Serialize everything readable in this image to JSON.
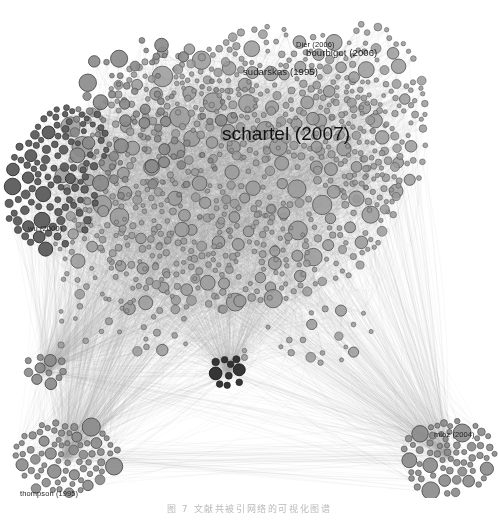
{
  "figure": {
    "type": "co-citation-network",
    "background": "#ffffff",
    "node_fill": "#999999",
    "node_stroke": "#5a5a5a",
    "edge_color": "#b0b0b0",
    "dark_node_fill": "#3a3a3a",
    "caption": "图 7 文献共被引网络的可视化图谱"
  },
  "labels": [
    {
      "text": "schartel (2007)",
      "x": 222,
      "y": 123,
      "size": "hero"
    },
    {
      "text": "bourbigot (2006)",
      "x": 306,
      "y": 47,
      "size": "mid"
    },
    {
      "text": "sudarskas (1995)",
      "x": 243,
      "y": 66,
      "size": "mid"
    },
    {
      "text": "wu (2000)",
      "x": 28,
      "y": 224,
      "size": "small"
    },
    {
      "text": "mioz (2004)",
      "x": 434,
      "y": 430,
      "size": "small"
    },
    {
      "text": "thompson (1995)",
      "x": 20,
      "y": 489,
      "size": "small"
    },
    {
      "text": "Dier (2006)",
      "x": 296,
      "y": 40,
      "size": "small"
    }
  ],
  "clusters": [
    {
      "name": "main-core",
      "cx": 240,
      "cy": 180,
      "rx": 185,
      "ry": 145,
      "count": 620,
      "tone": "light"
    },
    {
      "name": "left-dark-core",
      "cx": 52,
      "cy": 190,
      "rx": 50,
      "ry": 62,
      "count": 95,
      "tone": "dark"
    },
    {
      "name": "bottom-left-satellite",
      "cx": 66,
      "cy": 458,
      "rx": 52,
      "ry": 38,
      "count": 72,
      "tone": "mid"
    },
    {
      "name": "bottom-right-satellite",
      "cx": 448,
      "cy": 455,
      "rx": 48,
      "ry": 38,
      "count": 66,
      "tone": "mid"
    },
    {
      "name": "left-small-satellite",
      "cx": 44,
      "cy": 370,
      "rx": 22,
      "ry": 18,
      "count": 12,
      "tone": "mid"
    },
    {
      "name": "center-dark-cluster",
      "cx": 228,
      "cy": 372,
      "rx": 22,
      "ry": 18,
      "count": 14,
      "tone": "verydark"
    }
  ]
}
